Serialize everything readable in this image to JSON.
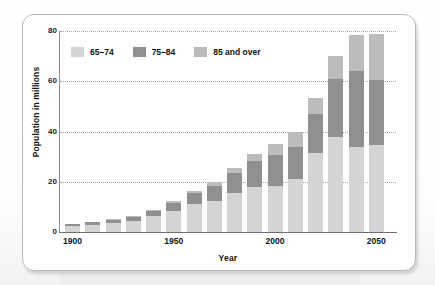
{
  "chart_data": {
    "type": "bar",
    "stacked": true,
    "title": "",
    "xlabel": "Year",
    "ylabel": "Population in millions",
    "ylim": [
      0,
      80
    ],
    "yticks": [
      0,
      20,
      40,
      60,
      80
    ],
    "grid": true,
    "legend_position": "top-left",
    "categories": [
      "1900",
      "1910",
      "1920",
      "1930",
      "1940",
      "1950",
      "1960",
      "1970",
      "1980",
      "1990",
      "2000",
      "2010",
      "2020",
      "2030",
      "2040",
      "2050"
    ],
    "xtick_labels": [
      "1900",
      "1950",
      "2000",
      "2050"
    ],
    "series": [
      {
        "name": "65–74",
        "color": "#d4d4d4",
        "values": [
          2.2,
          2.8,
          3.5,
          4.5,
          6.4,
          8.4,
          11.0,
          12.4,
          15.6,
          18.0,
          18.4,
          21.0,
          31.4,
          37.8,
          34.0,
          34.7
        ]
      },
      {
        "name": "75–84",
        "color": "#8f8f8f",
        "values": [
          0.8,
          1.0,
          1.2,
          1.6,
          2.0,
          3.3,
          4.6,
          6.1,
          7.7,
          10.1,
          12.4,
          13.0,
          15.4,
          23.3,
          30.1,
          26.0
        ]
      },
      {
        "name": "85 and over",
        "color": "#bcbcbc",
        "values": [
          0.1,
          0.2,
          0.3,
          0.4,
          0.5,
          0.6,
          0.9,
          1.5,
          2.2,
          3.1,
          4.3,
          5.7,
          6.6,
          8.9,
          14.2,
          18.2
        ]
      }
    ],
    "totals": [
      3.1,
      4.0,
      5.0,
      6.5,
      8.9,
      12.3,
      16.5,
      20.0,
      25.5,
      31.2,
      35.1,
      39.7,
      53.4,
      70.0,
      78.3,
      78.9
    ]
  },
  "legend": {
    "items": [
      {
        "label": "65–74",
        "color": "#d4d4d4"
      },
      {
        "label": "75–84",
        "color": "#8f8f8f"
      },
      {
        "label": "85 and over",
        "color": "#bcbcbc"
      }
    ]
  },
  "axes": {
    "y_title": "Population in millions",
    "x_title": "Year",
    "y_ticks": [
      "0",
      "20",
      "40",
      "60",
      "80"
    ],
    "x_ticks": [
      "1900",
      "1950",
      "2000",
      "2050"
    ]
  }
}
